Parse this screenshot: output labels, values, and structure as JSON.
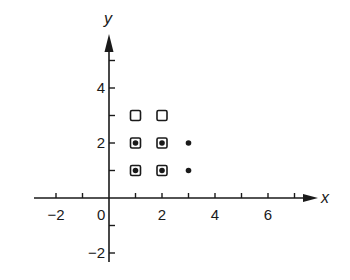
{
  "diagram": {
    "axes": {
      "x_label": "x",
      "y_label": "y",
      "x_ticks": [
        -2,
        -1,
        0,
        1,
        2,
        3,
        4,
        5,
        6,
        7
      ],
      "x_tick_labels": [
        {
          "value": -2,
          "text": "−2"
        },
        {
          "value": 0,
          "text": "0"
        },
        {
          "value": 2,
          "text": "2"
        },
        {
          "value": 4,
          "text": "4"
        },
        {
          "value": 6,
          "text": "6"
        }
      ],
      "y_ticks": [
        -2,
        -1,
        1,
        2,
        3,
        4,
        5
      ],
      "y_tick_labels": [
        {
          "value": 4,
          "text": "4"
        },
        {
          "value": 2,
          "text": "2"
        },
        {
          "value": -2,
          "text": "−2"
        }
      ],
      "color": "#1a1a1a"
    },
    "squares": [
      {
        "x": 1,
        "y": 1
      },
      {
        "x": 1,
        "y": 2
      },
      {
        "x": 1,
        "y": 3
      },
      {
        "x": 2,
        "y": 1
      },
      {
        "x": 2,
        "y": 2
      },
      {
        "x": 2,
        "y": 3
      }
    ],
    "dots": [
      {
        "x": 1,
        "y": 1
      },
      {
        "x": 1,
        "y": 2
      },
      {
        "x": 2,
        "y": 1
      },
      {
        "x": 2,
        "y": 2
      },
      {
        "x": 3,
        "y": 1
      },
      {
        "x": 3,
        "y": 2
      }
    ]
  }
}
